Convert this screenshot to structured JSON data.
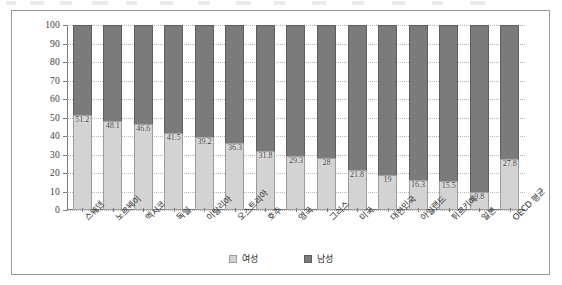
{
  "chart_data": {
    "type": "bar",
    "stacked": true,
    "percent": true,
    "title": "",
    "subtitle": "",
    "xlabel": "",
    "ylabel": "",
    "ylim": [
      0,
      100
    ],
    "yticks": [
      0,
      10,
      20,
      30,
      40,
      50,
      60,
      70,
      80,
      90,
      100
    ],
    "grid": true,
    "legend_position": "bottom",
    "categories": [
      "스웨덴",
      "노르웨이",
      "멕시코",
      "독일",
      "이탈리아",
      "오스트리아",
      "호주",
      "영국",
      "그리스",
      "미국",
      "대한민국",
      "아일랜드",
      "튀르키예",
      "일본",
      "OECD 평균"
    ],
    "series": [
      {
        "name": "여성",
        "color": "#d3d3d3",
        "values": [
          51.2,
          48.1,
          46.6,
          41.5,
          39.2,
          36.3,
          31.8,
          29.3,
          28,
          21.8,
          19,
          16.3,
          15.5,
          9.8,
          27.8
        ],
        "labels": [
          "51.2",
          "48.1",
          "46.6",
          "41.5",
          "39.2",
          "36.3",
          "31.8",
          "29.3",
          "28",
          "21.8",
          "19",
          "16.3",
          "15.5",
          "9.8",
          "27.8"
        ]
      },
      {
        "name": "남성",
        "color": "#7b7b7b",
        "values": [
          48.8,
          51.9,
          53.4,
          58.5,
          60.8,
          63.7,
          68.2,
          70.7,
          72,
          78.2,
          81,
          83.7,
          84.5,
          90.2,
          72.2
        ],
        "labels": [
          "",
          "",
          "",
          "",
          "",
          "",
          "",
          "",
          "",
          "",
          "",
          "",
          "",
          "",
          ""
        ]
      }
    ]
  },
  "legend": {
    "female_label": "여성",
    "male_label": "남성"
  },
  "colors": {
    "female": "#d3d3d3",
    "male": "#7b7b7b",
    "frame": "#9a9a9a",
    "axis": "#7a7a7a",
    "grid": "#b9b9b9"
  }
}
